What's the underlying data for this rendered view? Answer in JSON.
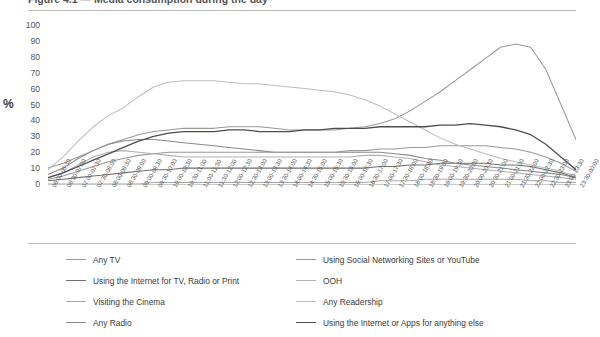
{
  "title": "Figure 4.1 — Media consumption during the day",
  "axis": {
    "y_unit": "%",
    "y_ticks": [
      "100",
      "90",
      "80",
      "70",
      "60",
      "50",
      "40",
      "30",
      "20",
      "10",
      "0"
    ],
    "y_min": 0,
    "y_max": 100
  },
  "legend": {
    "left": [
      {
        "label": "Any TV",
        "color": "#9a9a93"
      },
      {
        "label": "Using the Internet for TV, Radio or Print",
        "color": "#6e6e6e"
      },
      {
        "label": "Visiting the Cinema",
        "color": "#a8a8a8"
      },
      {
        "label": "Any Radio",
        "color": "#8a8a8a"
      }
    ],
    "right": [
      {
        "label": "Using Social Networking Sites or YouTube",
        "color": "#999999"
      },
      {
        "label": "OOH",
        "color": "#b0b0b0"
      },
      {
        "label": "Any Readership",
        "color": "#bdbdbd"
      },
      {
        "label": "Using the Internet or Apps for anything else",
        "color": "#4d4d4d"
      }
    ]
  },
  "chart_data": {
    "type": "line",
    "title": "Media consumption during the day",
    "xlabel": "",
    "ylabel": "%",
    "ylim": [
      0,
      100
    ],
    "grid": false,
    "legend_position": "bottom",
    "categories": [
      "06:00-06:30",
      "06:30-07:00",
      "07:00-07:30",
      "07:30-08:00",
      "08:00-08:30",
      "08:30-09:00",
      "09:00-09:30",
      "09:30-10:00",
      "10:00-10:30",
      "10:30-11:00",
      "11:00-11:30",
      "11:30-12:00",
      "12:00-12:30",
      "12:30-13:00",
      "13:00-13:30",
      "13:30-14:00",
      "14:00-14:30",
      "14:30-15:00",
      "15:00-15:30",
      "15:30-16:00",
      "16:00-16:30",
      "16:30-17:00",
      "17:00-17:30",
      "17:30-18:00",
      "18:00-18:30",
      "18:30-19:00",
      "19:00-19:30",
      "19:30-20:00",
      "20:00-20:30",
      "20:30-21:00",
      "21:00-21:30",
      "21:30-22:00",
      "22:00-22:30",
      "22:30-23:00",
      "23:00-23:30",
      "23:30-00:00"
    ],
    "series": [
      {
        "name": "Any TV",
        "color": "#9a9a93",
        "values": [
          10,
          13,
          17,
          21,
          25,
          28,
          31,
          33,
          34,
          35,
          35,
          35,
          36,
          36,
          36,
          35,
          34,
          34,
          34,
          34,
          35,
          36,
          38,
          41,
          46,
          52,
          58,
          65,
          72,
          79,
          86,
          88,
          86,
          72,
          50,
          28
        ]
      },
      {
        "name": "Using the Internet for TV, Radio or Print",
        "color": "#6e6e6e",
        "values": [
          2,
          3,
          4,
          5,
          6,
          7,
          8,
          9,
          9,
          10,
          10,
          10,
          10,
          10,
          10,
          10,
          10,
          10,
          10,
          10,
          10,
          10,
          11,
          11,
          12,
          12,
          13,
          13,
          13,
          13,
          12,
          12,
          11,
          9,
          7,
          4
        ]
      },
      {
        "name": "Visiting the Cinema",
        "color": "#a8a8a8",
        "values": [
          0,
          0,
          0,
          0,
          0,
          0,
          0,
          1,
          1,
          1,
          1,
          1,
          1,
          1,
          1,
          1,
          1,
          1,
          1,
          1,
          1,
          1,
          2,
          2,
          2,
          3,
          3,
          3,
          3,
          3,
          3,
          3,
          2,
          2,
          1,
          1
        ]
      },
      {
        "name": "Any Radio",
        "color": "#8a8a8a",
        "values": [
          6,
          10,
          16,
          21,
          25,
          27,
          28,
          28,
          27,
          26,
          25,
          24,
          23,
          22,
          21,
          20,
          20,
          20,
          20,
          20,
          20,
          20,
          20,
          19,
          18,
          16,
          15,
          13,
          12,
          11,
          10,
          9,
          8,
          7,
          6,
          4
        ]
      },
      {
        "name": "Using Social Networking Sites or YouTube",
        "color": "#999999",
        "values": [
          3,
          5,
          8,
          11,
          14,
          16,
          18,
          19,
          20,
          20,
          20,
          20,
          20,
          20,
          20,
          20,
          20,
          20,
          20,
          20,
          21,
          21,
          22,
          22,
          23,
          23,
          24,
          24,
          24,
          24,
          23,
          22,
          20,
          17,
          13,
          8
        ]
      },
      {
        "name": "OOH",
        "color": "#b0b0b0",
        "values": [
          4,
          7,
          12,
          17,
          20,
          21,
          20,
          19,
          18,
          17,
          17,
          17,
          17,
          17,
          17,
          17,
          17,
          17,
          17,
          17,
          17,
          18,
          18,
          17,
          16,
          14,
          12,
          11,
          10,
          9,
          8,
          7,
          6,
          5,
          4,
          3
        ]
      },
      {
        "name": "Any Readership",
        "color": "#bdbdbd",
        "values": [
          9,
          17,
          27,
          36,
          43,
          48,
          55,
          61,
          64,
          65,
          65,
          65,
          64,
          63,
          63,
          62,
          61,
          60,
          59,
          58,
          56,
          53,
          49,
          44,
          39,
          34,
          29,
          25,
          22,
          19,
          16,
          14,
          12,
          10,
          8,
          5
        ]
      },
      {
        "name": "Using the Internet or Apps for anything else",
        "color": "#4d4d4d",
        "values": [
          4,
          7,
          11,
          15,
          19,
          23,
          27,
          30,
          32,
          33,
          33,
          33,
          34,
          34,
          33,
          33,
          33,
          34,
          34,
          35,
          35,
          35,
          36,
          36,
          36,
          36,
          37,
          37,
          38,
          37,
          36,
          34,
          31,
          25,
          17,
          9
        ]
      }
    ]
  }
}
